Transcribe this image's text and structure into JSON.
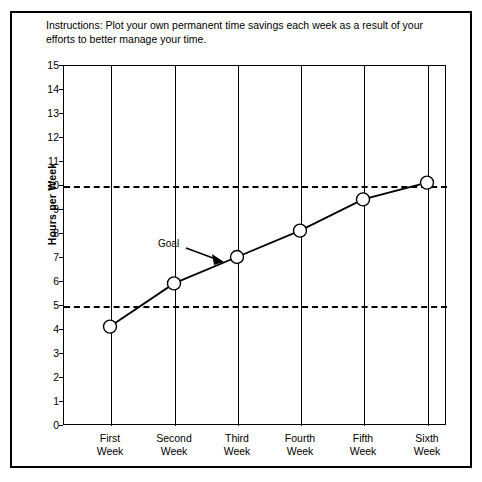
{
  "instructions": "Instructions: Plot your own permanent time savings each week as a result of your efforts to better manage your time.",
  "annotation": {
    "goal_label": "Goal"
  },
  "colors": {
    "line": "#000000",
    "frame": "#000000",
    "grid": "#000000",
    "background": "#ffffff"
  },
  "chart_data": {
    "type": "line",
    "title": "",
    "xlabel": "",
    "ylabel": "Hours per Week",
    "categories": [
      "First\nWeek",
      "Second\nWeek",
      "Third\nWeek",
      "Fourth\nWeek",
      "Fifth\nWeek",
      "Sixth\nWeek"
    ],
    "values": [
      4.1,
      5.9,
      7.0,
      8.1,
      9.4,
      10.1
    ],
    "ylim": [
      0,
      15
    ],
    "yticks": [
      15,
      14,
      13,
      12,
      11,
      10,
      9,
      8,
      7,
      6,
      5,
      4,
      3,
      2,
      1,
      0
    ],
    "ytick_labels": [
      "15",
      "14",
      "13",
      "12",
      "11",
      "10",
      "9",
      "8",
      "7",
      "6",
      "5",
      "4",
      "3",
      "2",
      "1",
      "0"
    ],
    "grid": "vertical-at-categories",
    "legend": "none",
    "marker": "open-circle",
    "reference_lines": [
      {
        "value": 5,
        "style": "dashed"
      },
      {
        "value": 10,
        "style": "dashed"
      }
    ],
    "annotations": [
      {
        "text": "Goal",
        "points_to_value": 7.0,
        "points_to_category": "Third\nWeek"
      }
    ]
  }
}
